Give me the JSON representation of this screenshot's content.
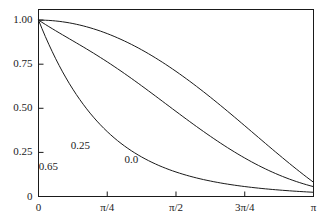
{
  "chart_data": {
    "type": "line",
    "title": "",
    "subtitle": "",
    "xlabel": "",
    "ylabel": "",
    "xlim": [
      0,
      3.14159265
    ],
    "ylim": [
      0,
      1.06
    ],
    "grid": false,
    "legend_position": "inline-curve-labels",
    "x_tick_labels": [
      "0",
      "π/4",
      "π/2",
      "3π/4",
      "π"
    ],
    "x_tick_values": [
      0,
      0.785398,
      1.570796,
      2.356194,
      3.141593
    ],
    "y_tick_labels": [
      "0",
      "0.25",
      "0.50",
      "0.75",
      "1.00"
    ],
    "y_tick_values": [
      0,
      0.25,
      0.5,
      0.75,
      1.0
    ],
    "line_color": "#1a1a1a",
    "frame_color": "#1a1a1a",
    "background_color": "#ffffff",
    "series": [
      {
        "name": "0.0",
        "label": "0.0",
        "label_x": 1.12,
        "label_y": 0.205,
        "x": [
          0.0,
          0.0393,
          0.0785,
          0.1178,
          0.1571,
          0.1963,
          0.2356,
          0.2749,
          0.3142,
          0.3534,
          0.3927,
          0.432,
          0.4712,
          0.5105,
          0.5498,
          0.589,
          0.6283,
          0.6676,
          0.7069,
          0.7461,
          0.7854,
          0.8247,
          0.8639,
          0.9032,
          0.9425,
          0.9817,
          1.021,
          1.0603,
          1.0996,
          1.1388,
          1.1781,
          1.2174,
          1.2566,
          1.2959,
          1.3352,
          1.3744,
          1.4137,
          1.453,
          1.4923,
          1.5315,
          1.5708,
          1.6101,
          1.6493,
          1.6886,
          1.7279,
          1.7671,
          1.8064,
          1.8457,
          1.885,
          1.9242,
          1.9635,
          2.0028,
          2.042,
          2.0813,
          2.1206,
          2.1598,
          2.1991,
          2.2384,
          2.2777,
          2.3169,
          2.3562,
          2.3955,
          2.4347,
          2.474,
          2.5133,
          2.5525,
          2.5918,
          2.6311,
          2.6704,
          2.7096,
          2.7489,
          2.7882,
          2.8274,
          2.8667,
          2.906,
          2.9452,
          2.9845,
          3.0238,
          3.0631,
          3.1023,
          3.1416
        ],
        "y": [
          1.0,
          0.9998,
          0.9992,
          0.9982,
          0.9968,
          0.995,
          0.9929,
          0.9903,
          0.9874,
          0.9841,
          0.9804,
          0.9763,
          0.9719,
          0.9671,
          0.9619,
          0.9564,
          0.9505,
          0.9442,
          0.9376,
          0.9306,
          0.9233,
          0.9156,
          0.9076,
          0.8992,
          0.8905,
          0.8815,
          0.8722,
          0.8625,
          0.8525,
          0.8422,
          0.8315,
          0.8206,
          0.8094,
          0.7978,
          0.786,
          0.7739,
          0.7615,
          0.7488,
          0.7359,
          0.7227,
          0.7093,
          0.6956,
          0.6817,
          0.6675,
          0.6532,
          0.6386,
          0.6238,
          0.6088,
          0.5937,
          0.5783,
          0.5628,
          0.5472,
          0.5314,
          0.5154,
          0.4994,
          0.4832,
          0.4669,
          0.4505,
          0.4341,
          0.4176,
          0.401,
          0.3844,
          0.3678,
          0.3511,
          0.3345,
          0.3179,
          0.3013,
          0.2847,
          0.2682,
          0.2518,
          0.2355,
          0.2193,
          0.2032,
          0.1872,
          0.1714,
          0.1558,
          0.1404,
          0.1251,
          0.1101,
          0.0954,
          0.0808
        ]
      },
      {
        "name": "0.25",
        "label": "0.25",
        "label_x": 0.505,
        "label_y": 0.287,
        "x": [
          0.0,
          0.0393,
          0.0785,
          0.1178,
          0.1571,
          0.1963,
          0.2356,
          0.2749,
          0.3142,
          0.3534,
          0.3927,
          0.432,
          0.4712,
          0.5105,
          0.5498,
          0.589,
          0.6283,
          0.6676,
          0.7069,
          0.7461,
          0.7854,
          0.8247,
          0.8639,
          0.9032,
          0.9425,
          0.9817,
          1.021,
          1.0603,
          1.0996,
          1.1388,
          1.1781,
          1.2174,
          1.2566,
          1.2959,
          1.3352,
          1.3744,
          1.4137,
          1.453,
          1.4923,
          1.5315,
          1.5708,
          1.6101,
          1.6493,
          1.6886,
          1.7279,
          1.7671,
          1.8064,
          1.8457,
          1.885,
          1.9242,
          1.9635,
          2.0028,
          2.042,
          2.0813,
          2.1206,
          2.1598,
          2.1991,
          2.2384,
          2.2777,
          2.3169,
          2.3562,
          2.3955,
          2.4347,
          2.474,
          2.5133,
          2.5525,
          2.5918,
          2.6311,
          2.6704,
          2.7096,
          2.7489,
          2.7882,
          2.8274,
          2.8667,
          2.906,
          2.9452,
          2.9845,
          3.0238,
          3.0631,
          3.1023,
          3.1416
        ],
        "y": [
          1.0,
          0.9875,
          0.9752,
          0.9632,
          0.9513,
          0.9396,
          0.928,
          0.9165,
          0.9051,
          0.8937,
          0.8823,
          0.8709,
          0.8594,
          0.8479,
          0.8362,
          0.8244,
          0.8125,
          0.8004,
          0.7881,
          0.7757,
          0.7631,
          0.7503,
          0.7373,
          0.7241,
          0.7108,
          0.6973,
          0.6836,
          0.6698,
          0.6558,
          0.6417,
          0.6275,
          0.6132,
          0.5988,
          0.5843,
          0.5698,
          0.5552,
          0.5406,
          0.526,
          0.5114,
          0.4968,
          0.4822,
          0.4677,
          0.4532,
          0.4388,
          0.4245,
          0.4103,
          0.3962,
          0.3823,
          0.3685,
          0.3548,
          0.3413,
          0.328,
          0.3149,
          0.302,
          0.2893,
          0.2768,
          0.2646,
          0.2526,
          0.2408,
          0.2293,
          0.2181,
          0.2071,
          0.1964,
          0.186,
          0.1759,
          0.1661,
          0.1566,
          0.1474,
          0.1385,
          0.1299,
          0.1216,
          0.1136,
          0.106,
          0.0986,
          0.0916,
          0.0849,
          0.0785,
          0.0724,
          0.0666,
          0.0611,
          0.056
        ]
      },
      {
        "name": "0.65",
        "label": "0.65",
        "label_x": 0.14,
        "label_y": 0.165,
        "x": [
          0.0,
          0.0393,
          0.0785,
          0.1178,
          0.1571,
          0.1963,
          0.2356,
          0.2749,
          0.3142,
          0.3534,
          0.3927,
          0.432,
          0.4712,
          0.5105,
          0.5498,
          0.589,
          0.6283,
          0.6676,
          0.7069,
          0.7461,
          0.7854,
          0.8247,
          0.8639,
          0.9032,
          0.9425,
          0.9817,
          1.021,
          1.0603,
          1.0996,
          1.1388,
          1.1781,
          1.2174,
          1.2566,
          1.2959,
          1.3352,
          1.3744,
          1.4137,
          1.453,
          1.4923,
          1.5315,
          1.5708,
          1.6101,
          1.6493,
          1.6886,
          1.7279,
          1.7671,
          1.8064,
          1.8457,
          1.885,
          1.9242,
          1.9635,
          2.0028,
          2.042,
          2.0813,
          2.1206,
          2.1598,
          2.1991,
          2.2384,
          2.2777,
          2.3169,
          2.3562,
          2.3955,
          2.4347,
          2.474,
          2.5133,
          2.5525,
          2.5918,
          2.6311,
          2.6704,
          2.7096,
          2.7489,
          2.7882,
          2.8274,
          2.8667,
          2.906,
          2.9452,
          2.9845,
          3.0238,
          3.0631,
          3.1023,
          3.1416
        ],
        "y": [
          1.0,
          0.9522,
          0.9064,
          0.8627,
          0.8209,
          0.781,
          0.743,
          0.7067,
          0.6722,
          0.6393,
          0.608,
          0.5781,
          0.5498,
          0.5228,
          0.4971,
          0.4727,
          0.4495,
          0.4274,
          0.4065,
          0.3866,
          0.3677,
          0.3497,
          0.3327,
          0.3165,
          0.3011,
          0.2866,
          0.2727,
          0.2596,
          0.2471,
          0.2353,
          0.2241,
          0.2134,
          0.2033,
          0.1937,
          0.1846,
          0.1759,
          0.1677,
          0.1599,
          0.1525,
          0.1455,
          0.1388,
          0.1324,
          0.1264,
          0.1207,
          0.1152,
          0.11,
          0.1051,
          0.1004,
          0.0959,
          0.0917,
          0.0877,
          0.0838,
          0.0802,
          0.0767,
          0.0733,
          0.0702,
          0.0671,
          0.0643,
          0.0615,
          0.0589,
          0.0564,
          0.054,
          0.0517,
          0.0495,
          0.0474,
          0.0454,
          0.0435,
          0.0417,
          0.0399,
          0.0383,
          0.0367,
          0.0351,
          0.0337,
          0.0323,
          0.0309,
          0.0296,
          0.0284,
          0.0272,
          0.0261,
          0.025,
          0.024
        ]
      }
    ]
  }
}
